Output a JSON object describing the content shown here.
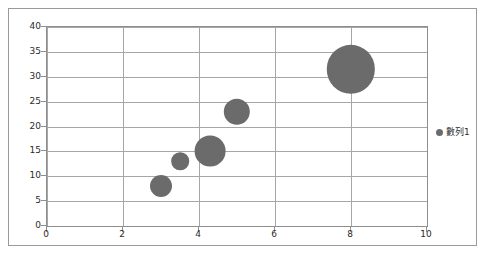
{
  "chart_data": {
    "type": "scatter",
    "title": "",
    "xlabel": "",
    "ylabel": "",
    "xlim": [
      0,
      10
    ],
    "ylim": [
      0,
      40
    ],
    "x_ticks": [
      "0",
      "2",
      "4",
      "6",
      "8",
      "10"
    ],
    "y_ticks": [
      "0",
      "5",
      "10",
      "15",
      "20",
      "25",
      "30",
      "35",
      "40"
    ],
    "grid": "both",
    "legend_position": "right",
    "series": [
      {
        "name": "數列1",
        "color": "#6b6b6b",
        "points": [
          {
            "x": 3,
            "y": 8,
            "size": 5
          },
          {
            "x": 3.5,
            "y": 13,
            "size": 4
          },
          {
            "x": 4.3,
            "y": 15,
            "size": 7
          },
          {
            "x": 5,
            "y": 23,
            "size": 6
          },
          {
            "x": 8,
            "y": 31.5,
            "size": 11
          }
        ]
      }
    ]
  },
  "legend": {
    "entries": [
      {
        "label": "數列1",
        "marker": "circle-marker",
        "color": "#6b6b6b"
      }
    ]
  },
  "colors": {
    "bubble_fill": "#6b6b6b",
    "gridline": "#a6a6a6",
    "axis": "#8e8e8e",
    "frame": "#9a9a9a",
    "plot_background": "#ffffff",
    "text": "#2b2b2b"
  }
}
